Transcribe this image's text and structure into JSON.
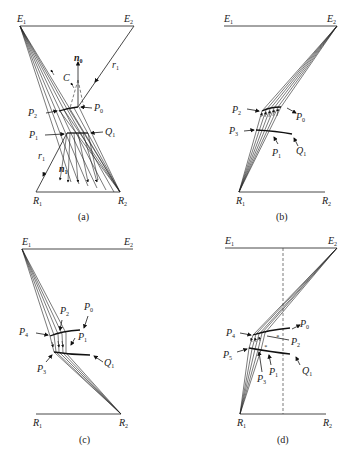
{
  "figure": {
    "panels": [
      {
        "id": "a",
        "caption": "(a)",
        "labels": {
          "E1": "E",
          "E1_sub": "1",
          "E2": "E",
          "E2_sub": "2",
          "R1": "R",
          "R1_sub": "1",
          "R2": "R",
          "R2_sub": "2",
          "n0": "n",
          "n0_sub": "0",
          "n1": "n",
          "n1_sub": "1",
          "C": "C",
          "r1_top": "r",
          "r1_top_sub": "1",
          "r1_bottom": "r",
          "r1_bottom_sub": "1",
          "P0": "P",
          "P0_sub": "0",
          "P1": "P",
          "P1_sub": "1",
          "P2": "P",
          "P2_sub": "2",
          "Q1": "Q",
          "Q1_sub": "1"
        }
      },
      {
        "id": "b",
        "caption": "(b)",
        "labels": {
          "E1": "E",
          "E1_sub": "1",
          "E2": "E",
          "E2_sub": "2",
          "R1": "R",
          "R1_sub": "1",
          "R2": "R",
          "R2_sub": "2",
          "P0": "P",
          "P0_sub": "0",
          "P1": "P",
          "P1_sub": "1",
          "P2": "P",
          "P2_sub": "2",
          "P3": "P",
          "P3_sub": "3",
          "Q1": "Q",
          "Q1_sub": "1"
        }
      },
      {
        "id": "c",
        "caption": "(c)",
        "labels": {
          "E1": "E",
          "E1_sub": "1",
          "E2": "E",
          "E2_sub": "2",
          "R1": "R",
          "R1_sub": "1",
          "R2": "R",
          "R2_sub": "2",
          "P0": "P",
          "P0_sub": "0",
          "P1": "P",
          "P1_sub": "1",
          "P2": "P",
          "P2_sub": "2",
          "P3": "P",
          "P3_sub": "3",
          "P4": "P",
          "P4_sub": "4",
          "Q1": "Q",
          "Q1_sub": "1"
        }
      },
      {
        "id": "d",
        "caption": "(d)",
        "labels": {
          "E1": "E",
          "E1_sub": "1",
          "E2": "E",
          "E2_sub": "2",
          "R1": "R",
          "R1_sub": "1",
          "R2": "R",
          "R2_sub": "2",
          "P0": "P",
          "P0_sub": "0",
          "P1": "P",
          "P1_sub": "1",
          "P2": "P",
          "P2_sub": "2",
          "P3": "P",
          "P3_sub": "3",
          "P4": "P",
          "P4_sub": "4",
          "P5": "P",
          "P5_sub": "5",
          "Q1": "Q",
          "Q1_sub": "1"
        }
      }
    ]
  }
}
